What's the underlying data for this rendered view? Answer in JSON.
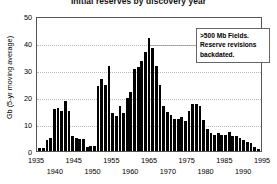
{
  "chart_data": {
    "type": "bar",
    "title": "Initial reserves by discovery year",
    "xlabel": "",
    "ylabel": "Gb (5-yr moving average)",
    "ylim": [
      0,
      50
    ],
    "yticks": [
      0,
      10,
      20,
      30,
      40,
      50
    ],
    "xlim": [
      1935,
      1995
    ],
    "xticks": [
      1935,
      1940,
      1945,
      1950,
      1955,
      1960,
      1965,
      1970,
      1975,
      1980,
      1985,
      1990,
      1995
    ],
    "grid": true,
    "legend": false,
    "bar_color": "#000000",
    "annotations": [
      {
        "lines": [
          ">500 Mb Fields.",
          "Reserve revisions",
          "backdated."
        ],
        "boxed": true
      }
    ],
    "categories": [
      1935,
      1936,
      1937,
      1938,
      1939,
      1940,
      1941,
      1942,
      1943,
      1944,
      1945,
      1946,
      1947,
      1948,
      1949,
      1950,
      1951,
      1952,
      1953,
      1954,
      1955,
      1956,
      1957,
      1958,
      1959,
      1960,
      1961,
      1962,
      1963,
      1964,
      1965,
      1966,
      1967,
      1968,
      1969,
      1970,
      1971,
      1972,
      1973,
      1974,
      1975,
      1976,
      1977,
      1978,
      1979,
      1980,
      1981,
      1982,
      1983,
      1984,
      1985,
      1986,
      1987,
      1988,
      1989,
      1990,
      1991,
      1992,
      1993,
      1994,
      1995
    ],
    "values": [
      1.0,
      1.2,
      4.0,
      5.0,
      15.5,
      16.0,
      15.0,
      18.5,
      15.0,
      5.5,
      5.0,
      4.5,
      4.5,
      1.5,
      2.0,
      2.0,
      24.0,
      26.5,
      24.5,
      31.5,
      14.0,
      13.0,
      16.5,
      14.0,
      19.5,
      22.0,
      30.5,
      31.0,
      33.5,
      36.5,
      42.0,
      38.0,
      31.5,
      24.5,
      16.5,
      14.5,
      13.5,
      12.0,
      12.0,
      12.5,
      11.0,
      15.0,
      17.5,
      17.5,
      16.5,
      11.5,
      8.0,
      6.5,
      6.0,
      6.5,
      6.0,
      6.0,
      7.0,
      5.5,
      5.5,
      5.0,
      4.0,
      3.5,
      3.0,
      1.5,
      0.6
    ]
  }
}
